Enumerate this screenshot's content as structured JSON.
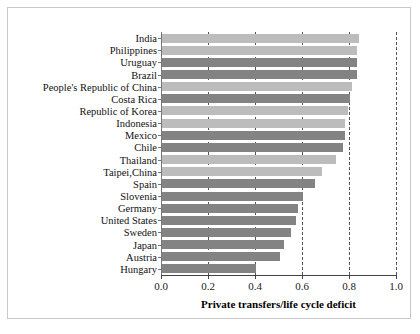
{
  "chart_data": {
    "type": "bar",
    "orientation": "horizontal",
    "title": "",
    "xlabel": "Private transfers/life cycle deficit",
    "ylabel": "",
    "xlim": [
      0.0,
      1.0
    ],
    "xticks": [
      "0.0",
      "0.2",
      "0.4",
      "0.6",
      "0.8",
      "1.0"
    ],
    "xtick_values": [
      0.0,
      0.2,
      0.4,
      0.6,
      0.8,
      1.0
    ],
    "grid": "vertical dashed gridlines at 0.2, 0.4, 0.6, 0.8, 1.0",
    "legend": "none",
    "categories": [
      "India",
      "Philippines",
      "Uruguay",
      "Brazil",
      "People's Republic of China",
      "Costa Rica",
      "Republic of Korea",
      "Indonesia",
      "Mexico",
      "Chile",
      "Thailand",
      "Taipei,China",
      "Spain",
      "Slovenia",
      "Germany",
      "United States",
      "Sweden",
      "Japan",
      "Austria",
      "Hungary"
    ],
    "values": [
      0.84,
      0.83,
      0.83,
      0.83,
      0.81,
      0.8,
      0.79,
      0.78,
      0.78,
      0.77,
      0.74,
      0.68,
      0.65,
      0.6,
      0.58,
      0.57,
      0.55,
      0.52,
      0.5,
      0.4
    ],
    "colors": {
      "bar_light": "#bcbcbc",
      "bar_dark": "#838383",
      "axis": "#444444",
      "gridline": "#555555",
      "frame": "#c9c9c9",
      "background": "#ffffff"
    },
    "bar_shades": [
      "light",
      "light",
      "dark",
      "dark",
      "light",
      "dark",
      "light",
      "light",
      "dark",
      "dark",
      "light",
      "light",
      "dark",
      "dark",
      "dark",
      "dark",
      "dark",
      "dark",
      "dark",
      "dark"
    ]
  }
}
